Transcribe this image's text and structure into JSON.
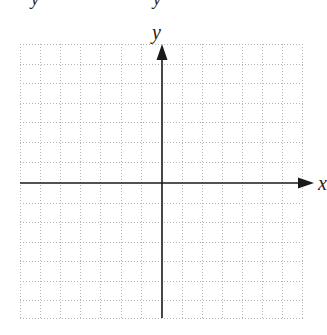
{
  "top_fragments": [
    {
      "text": "y",
      "x": 31
    },
    {
      "text": "y",
      "x": 153
    }
  ],
  "plane": {
    "x_axis_label": "x",
    "y_axis_label": "y",
    "columns_each_side": 7,
    "rows_each_side": 7,
    "grid_color": "#b5b5b5",
    "axis_color": "#1a1a1a"
  }
}
